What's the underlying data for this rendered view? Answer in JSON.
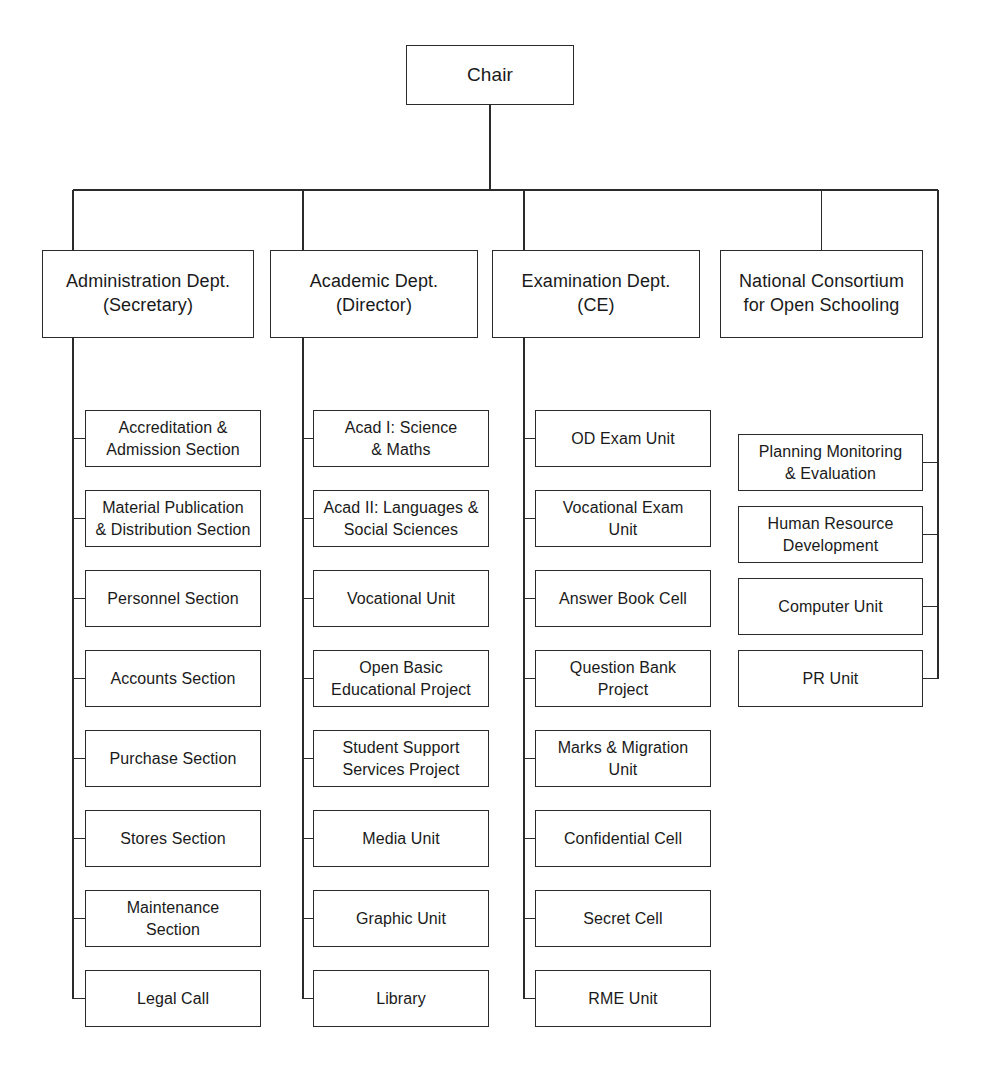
{
  "chart": {
    "type": "org-chart",
    "line_color": "#2b2b2b",
    "background_color": "#ffffff",
    "root": {
      "label": "Chair"
    },
    "departments": [
      {
        "id": "administration",
        "label": "Administration Dept.\n(Secretary)",
        "children": [
          {
            "label": "Accreditation &\nAdmission Section"
          },
          {
            "label": "Material Publication\n& Distribution Section"
          },
          {
            "label": "Personnel Section"
          },
          {
            "label": "Accounts Section"
          },
          {
            "label": "Purchase Section"
          },
          {
            "label": "Stores Section"
          },
          {
            "label": "Maintenance\nSection"
          },
          {
            "label": "Legal Call"
          }
        ]
      },
      {
        "id": "academic",
        "label": "Academic Dept.\n(Director)",
        "children": [
          {
            "label": "Acad I: Science\n& Maths"
          },
          {
            "label": "Acad II: Languages &\nSocial Sciences"
          },
          {
            "label": "Vocational Unit"
          },
          {
            "label": "Open Basic\nEducational Project"
          },
          {
            "label": "Student Support\nServices Project"
          },
          {
            "label": "Media Unit"
          },
          {
            "label": "Graphic Unit"
          },
          {
            "label": "Library"
          }
        ]
      },
      {
        "id": "examination",
        "label": "Examination Dept.\n(CE)",
        "children": [
          {
            "label": "OD Exam Unit"
          },
          {
            "label": "Vocational Exam\nUnit"
          },
          {
            "label": "Answer Book Cell"
          },
          {
            "label": "Question Bank\nProject"
          },
          {
            "label": "Marks & Migration\nUnit"
          },
          {
            "label": "Confidential Cell"
          },
          {
            "label": "Secret Cell"
          },
          {
            "label": "RME Unit"
          }
        ]
      },
      {
        "id": "national-consortium",
        "label": "National Consortium\nfor Open Schooling",
        "children": [
          {
            "label": "Planning Monitoring\n& Evaluation"
          },
          {
            "label": "Human Resource\nDevelopment"
          },
          {
            "label": "Computer Unit"
          },
          {
            "label": "PR Unit"
          }
        ]
      }
    ]
  }
}
